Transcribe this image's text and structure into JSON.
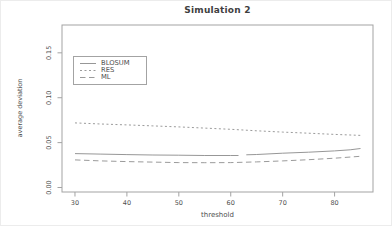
{
  "chart_data": {
    "type": "line",
    "title": "Simulation 2",
    "xlabel": "threshold",
    "ylabel": "average deviation",
    "xlim": [
      27.5,
      87.4
    ],
    "ylim": [
      -0.005,
      0.181
    ],
    "x_ticks": [
      30,
      40,
      50,
      60,
      70,
      80
    ],
    "y_ticks": [
      0.0,
      0.05,
      0.1,
      0.15
    ],
    "y_tick_labels": [
      "0.00",
      "0.05",
      "0.10",
      "0.15"
    ],
    "grid": false,
    "legend_position": "top-left",
    "axis_color": "#a3a3a3",
    "tick_text_color": "#4f4f4f",
    "series": [
      {
        "name": "BLOSUM",
        "line_style": "solid",
        "color": "#979797",
        "points": [
          [
            30,
            0.0378
          ],
          [
            35,
            0.0372
          ],
          [
            40,
            0.0367
          ],
          [
            45,
            0.0362
          ],
          [
            50,
            0.036
          ],
          [
            55,
            0.0357
          ],
          [
            60,
            0.0356
          ],
          [
            61.5,
            0.0357
          ],
          null,
          [
            63,
            0.0364
          ],
          [
            65,
            0.0368
          ],
          [
            70,
            0.0382
          ],
          [
            75,
            0.0393
          ],
          [
            80,
            0.0408
          ],
          [
            83,
            0.042
          ],
          [
            85,
            0.0435
          ]
        ]
      },
      {
        "name": "RES",
        "line_style": "dashed-short",
        "color": "#9b9b9b",
        "points": [
          [
            30,
            0.072
          ],
          [
            35,
            0.0707
          ],
          [
            40,
            0.0697
          ],
          [
            45,
            0.0686
          ],
          [
            50,
            0.0675
          ],
          [
            55,
            0.0662
          ],
          [
            60,
            0.0648
          ],
          [
            65,
            0.0632
          ],
          [
            70,
            0.0617
          ],
          [
            75,
            0.0605
          ],
          [
            80,
            0.0592
          ],
          [
            85,
            0.058
          ]
        ]
      },
      {
        "name": "ML",
        "line_style": "dashed",
        "color": "#9b9b9b",
        "points": [
          [
            30,
            0.0308
          ],
          [
            35,
            0.0296
          ],
          [
            40,
            0.0289
          ],
          [
            45,
            0.0283
          ],
          [
            50,
            0.0278
          ],
          [
            55,
            0.0276
          ],
          [
            60,
            0.0278
          ],
          [
            65,
            0.0285
          ],
          [
            70,
            0.0296
          ],
          [
            75,
            0.031
          ],
          [
            80,
            0.0326
          ],
          [
            85,
            0.0348
          ]
        ]
      }
    ]
  }
}
